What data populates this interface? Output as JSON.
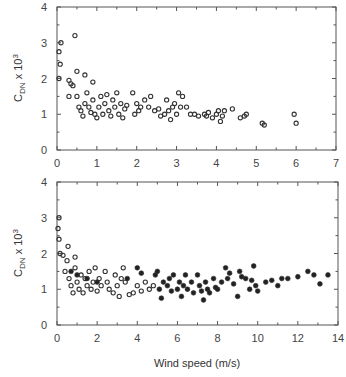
{
  "chart_data": [
    {
      "type": "scatter",
      "title": "",
      "xlabel": "",
      "ylabel": "C_DN x 10^3",
      "xlim": [
        0,
        7
      ],
      "ylim": [
        0,
        4
      ],
      "xticks": [
        "0",
        "1",
        "2",
        "3",
        "4",
        "5",
        "6",
        "7"
      ],
      "yticks": [
        "0",
        "1",
        "2",
        "3",
        "4"
      ],
      "grid": false,
      "series": [
        {
          "name": "open circles",
          "marker": "open-circle",
          "points": [
            [
              0.05,
              2.75
            ],
            [
              0.1,
              3.0
            ],
            [
              0.08,
              2.4
            ],
            [
              0.05,
              2.0
            ],
            [
              0.45,
              3.2
            ],
            [
              0.5,
              2.2
            ],
            [
              0.7,
              2.1
            ],
            [
              0.3,
              1.95
            ],
            [
              0.35,
              1.85
            ],
            [
              0.4,
              1.8
            ],
            [
              0.3,
              1.5
            ],
            [
              0.5,
              1.5
            ],
            [
              0.55,
              1.2
            ],
            [
              0.6,
              1.1
            ],
            [
              0.65,
              0.95
            ],
            [
              0.7,
              1.3
            ],
            [
              0.75,
              1.6
            ],
            [
              0.8,
              1.2
            ],
            [
              0.85,
              1.05
            ],
            [
              0.9,
              1.4
            ],
            [
              0.95,
              1.0
            ],
            [
              0.9,
              1.9
            ],
            [
              1.0,
              0.9
            ],
            [
              1.05,
              1.2
            ],
            [
              1.1,
              1.5
            ],
            [
              1.15,
              1.0
            ],
            [
              1.2,
              1.3
            ],
            [
              1.25,
              1.55
            ],
            [
              1.3,
              1.1
            ],
            [
              1.35,
              0.95
            ],
            [
              1.4,
              1.4
            ],
            [
              1.45,
              1.2
            ],
            [
              1.5,
              1.6
            ],
            [
              1.55,
              1.0
            ],
            [
              1.6,
              1.3
            ],
            [
              1.65,
              0.9
            ],
            [
              1.7,
              1.15
            ],
            [
              1.75,
              1.25
            ],
            [
              1.9,
              1.6
            ],
            [
              1.95,
              1.0
            ],
            [
              2.0,
              1.3
            ],
            [
              2.05,
              1.1
            ],
            [
              2.1,
              1.2
            ],
            [
              2.2,
              1.4
            ],
            [
              2.3,
              1.2
            ],
            [
              2.35,
              1.5
            ],
            [
              2.45,
              1.1
            ],
            [
              2.55,
              1.15
            ],
            [
              2.6,
              0.95
            ],
            [
              2.7,
              1.0
            ],
            [
              2.75,
              1.4
            ],
            [
              2.8,
              1.1
            ],
            [
              2.85,
              0.85
            ],
            [
              2.9,
              1.2
            ],
            [
              2.95,
              1.3
            ],
            [
              3.0,
              1.0
            ],
            [
              3.05,
              1.6
            ],
            [
              3.1,
              1.2
            ],
            [
              3.15,
              1.5
            ],
            [
              3.25,
              1.2
            ],
            [
              3.35,
              1.0
            ],
            [
              3.45,
              1.0
            ],
            [
              3.55,
              0.95
            ],
            [
              3.7,
              1.0
            ],
            [
              3.75,
              0.95
            ],
            [
              3.8,
              1.05
            ],
            [
              3.9,
              0.9
            ],
            [
              4.0,
              1.0
            ],
            [
              4.05,
              1.1
            ],
            [
              4.1,
              0.8
            ],
            [
              4.15,
              0.95
            ],
            [
              4.2,
              1.1
            ],
            [
              4.4,
              1.15
            ],
            [
              4.6,
              0.9
            ],
            [
              4.7,
              0.95
            ],
            [
              4.75,
              1.0
            ],
            [
              5.15,
              0.75
            ],
            [
              5.2,
              0.7
            ],
            [
              5.95,
              1.0
            ],
            [
              6.0,
              0.75
            ]
          ]
        }
      ]
    },
    {
      "type": "scatter",
      "title": "",
      "xlabel": "Wind speed (m/s)",
      "ylabel": "C_DN x 10^3",
      "xlim": [
        0,
        14
      ],
      "ylim": [
        0,
        4
      ],
      "xticks": [
        "0",
        "2",
        "4",
        "6",
        "8",
        "10",
        "12",
        "14"
      ],
      "yticks": [
        "0",
        "1",
        "2",
        "3",
        "4"
      ],
      "grid": false,
      "series": [
        {
          "name": "open circles",
          "marker": "open-circle",
          "points": [
            [
              0.05,
              2.7
            ],
            [
              0.1,
              3.0
            ],
            [
              0.1,
              2.4
            ],
            [
              0.15,
              2.0
            ],
            [
              0.3,
              1.95
            ],
            [
              0.5,
              1.8
            ],
            [
              0.55,
              2.2
            ],
            [
              0.9,
              1.9
            ],
            [
              0.4,
              1.5
            ],
            [
              0.6,
              1.3
            ],
            [
              0.7,
              1.1
            ],
            [
              0.8,
              0.9
            ],
            [
              0.9,
              1.6
            ],
            [
              1.0,
              1.2
            ],
            [
              1.1,
              1.0
            ],
            [
              1.2,
              1.4
            ],
            [
              1.3,
              0.9
            ],
            [
              1.4,
              1.3
            ],
            [
              1.5,
              1.1
            ],
            [
              1.6,
              1.5
            ],
            [
              1.7,
              1.0
            ],
            [
              1.8,
              1.2
            ],
            [
              1.9,
              1.6
            ],
            [
              2.0,
              0.95
            ],
            [
              2.1,
              1.3
            ],
            [
              2.2,
              1.1
            ],
            [
              2.4,
              1.5
            ],
            [
              2.5,
              1.2
            ],
            [
              2.6,
              1.0
            ],
            [
              2.8,
              0.9
            ],
            [
              2.9,
              1.4
            ],
            [
              3.0,
              1.1
            ],
            [
              3.1,
              0.8
            ],
            [
              3.2,
              1.3
            ],
            [
              3.3,
              1.6
            ],
            [
              3.4,
              1.2
            ],
            [
              3.6,
              0.85
            ],
            [
              3.8,
              0.9
            ],
            [
              4.0,
              1.1
            ],
            [
              4.2,
              0.95
            ],
            [
              4.4,
              1.2
            ],
            [
              4.6,
              1.0
            ],
            [
              4.8,
              1.1
            ]
          ]
        },
        {
          "name": "filled circles",
          "marker": "filled-circle",
          "points": [
            [
              0.7,
              1.5
            ],
            [
              1.0,
              1.4
            ],
            [
              1.5,
              1.3
            ],
            [
              2.0,
              1.2
            ],
            [
              3.5,
              1.3
            ],
            [
              4.0,
              1.6
            ],
            [
              4.2,
              1.45
            ],
            [
              4.9,
              1.4
            ],
            [
              5.0,
              1.5
            ],
            [
              5.1,
              1.0
            ],
            [
              5.2,
              0.75
            ],
            [
              5.3,
              1.2
            ],
            [
              5.5,
              1.1
            ],
            [
              5.6,
              1.3
            ],
            [
              5.7,
              0.95
            ],
            [
              5.8,
              1.4
            ],
            [
              6.0,
              1.0
            ],
            [
              6.1,
              1.2
            ],
            [
              6.2,
              0.8
            ],
            [
              6.3,
              1.1
            ],
            [
              6.4,
              1.4
            ],
            [
              6.5,
              1.0
            ],
            [
              6.7,
              1.2
            ],
            [
              6.8,
              0.9
            ],
            [
              7.0,
              1.4
            ],
            [
              7.1,
              1.1
            ],
            [
              7.2,
              0.95
            ],
            [
              7.3,
              0.7
            ],
            [
              7.4,
              1.2
            ],
            [
              7.5,
              1.0
            ],
            [
              7.6,
              0.9
            ],
            [
              7.8,
              1.3
            ],
            [
              7.9,
              1.05
            ],
            [
              8.0,
              1.0
            ],
            [
              8.2,
              1.2
            ],
            [
              8.4,
              1.6
            ],
            [
              8.5,
              1.3
            ],
            [
              8.6,
              1.45
            ],
            [
              8.8,
              1.15
            ],
            [
              9.0,
              0.8
            ],
            [
              9.1,
              1.5
            ],
            [
              9.2,
              1.35
            ],
            [
              9.4,
              1.3
            ],
            [
              9.6,
              1.0
            ],
            [
              9.7,
              1.25
            ],
            [
              9.8,
              1.65
            ],
            [
              9.9,
              1.1
            ],
            [
              10.0,
              0.95
            ],
            [
              10.4,
              1.2
            ],
            [
              10.7,
              1.25
            ],
            [
              11.0,
              1.1
            ],
            [
              11.2,
              1.3
            ],
            [
              11.5,
              1.3
            ],
            [
              12.0,
              1.35
            ],
            [
              12.5,
              1.5
            ],
            [
              12.8,
              1.4
            ],
            [
              13.1,
              1.15
            ],
            [
              13.5,
              1.4
            ]
          ]
        }
      ]
    }
  ],
  "axes": {
    "ylabel_main": "C",
    "ylabel_sub": "DN",
    "ylabel_rest": " x 10",
    "ylabel_sup": "3",
    "xlabel": "Wind speed (m/s)"
  }
}
